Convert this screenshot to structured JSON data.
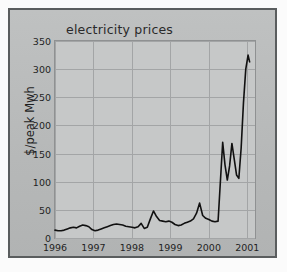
{
  "figure": {
    "background_color": "#fbfbfb",
    "panel_color": "#b9bbbb",
    "frame_color": "#5a5d5e",
    "plot_background_color": "#c6c8c8",
    "gridline_color": "#a3a5a6",
    "line_color": "#111111"
  },
  "chart_data": {
    "type": "line",
    "title": "electricity prices",
    "xlabel": "",
    "ylabel": "$/peak Mwh",
    "xlim": [
      1996.0,
      2001.2
    ],
    "ylim": [
      0,
      350
    ],
    "grid": true,
    "legend": false,
    "y_ticks": [
      0,
      50,
      100,
      150,
      200,
      250,
      300,
      350
    ],
    "y_tick_labels": [
      "0",
      "50",
      "100",
      "150",
      "200",
      "250",
      "300",
      "350"
    ],
    "x_ticks": [
      1996,
      1997,
      1998,
      1999,
      2000,
      2001
    ],
    "x_tick_labels": [
      "1996",
      "1997",
      "1998",
      "1999",
      "2000",
      "2001"
    ],
    "series": [
      {
        "name": "electricity price",
        "x": [
          1996.0,
          1996.08,
          1996.16,
          1996.24,
          1996.32,
          1996.4,
          1996.48,
          1996.56,
          1996.64,
          1996.72,
          1996.8,
          1996.88,
          1996.96,
          1997.04,
          1997.12,
          1997.2,
          1997.28,
          1997.36,
          1997.44,
          1997.52,
          1997.6,
          1997.68,
          1997.76,
          1997.84,
          1997.92,
          1998.0,
          1998.08,
          1998.16,
          1998.24,
          1998.32,
          1998.4,
          1998.48,
          1998.56,
          1998.64,
          1998.72,
          1998.8,
          1998.88,
          1998.96,
          1999.04,
          1999.12,
          1999.2,
          1999.28,
          1999.36,
          1999.44,
          1999.52,
          1999.6,
          1999.68,
          1999.76,
          1999.84,
          1999.92,
          2000.0,
          2000.08,
          2000.16,
          2000.24,
          2000.3,
          2000.36,
          2000.42,
          2000.48,
          2000.54,
          2000.6,
          2000.66,
          2000.72,
          2000.78,
          2000.84,
          2000.9,
          2000.96,
          2001.02,
          2001.06
        ],
        "y": [
          14,
          13,
          13,
          14,
          16,
          18,
          19,
          18,
          21,
          23,
          22,
          20,
          15,
          13,
          14,
          16,
          18,
          20,
          22,
          24,
          25,
          24,
          23,
          21,
          20,
          19,
          18,
          20,
          26,
          17,
          19,
          34,
          48,
          38,
          31,
          30,
          29,
          30,
          28,
          24,
          22,
          23,
          26,
          28,
          30,
          34,
          44,
          62,
          40,
          35,
          33,
          30,
          29,
          30,
          100,
          170,
          130,
          103,
          128,
          168,
          140,
          112,
          106,
          160,
          240,
          300,
          325,
          313
        ]
      }
    ],
    "annotations": []
  }
}
